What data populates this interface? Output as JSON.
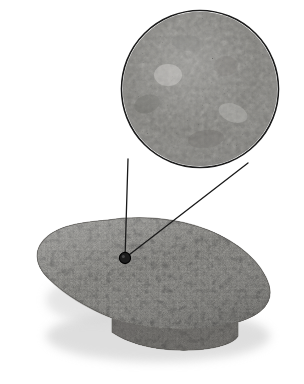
{
  "figure": {
    "background_color": "#ffffff",
    "width": 304,
    "height": 384,
    "caption": "",
    "labels": []
  },
  "specimen": {
    "name": "rock-slab",
    "description": "Elongated oval granular rock slab shown in oblique perspective with visible side thickness and cast shadow",
    "bounds": {
      "x": 33,
      "y": 216,
      "width": 238,
      "height": 136
    },
    "fill_color": "#a9a8a4",
    "side_color": "#6e6d6a",
    "shadow_color": "#cfcfcf",
    "texture": "coarse-granular",
    "texture_light": "#d6d5d1",
    "texture_dark": "#4f4e4c"
  },
  "callout": {
    "name": "magnifier-inset",
    "description": "Circular magnified view of the rock surface microstructure",
    "center_x": 200,
    "center_y": 89,
    "radius": 78,
    "ring_color": "#1a1a1a",
    "ring_width": 1.6,
    "fill_color": "#b4b3af",
    "texture": "fine-mottled",
    "texture_light": "#dedddA",
    "texture_dark": "#5c5b59"
  },
  "pointer": {
    "name": "callout-leader-lines",
    "color": "#1a1a1a",
    "width": 1.3,
    "target_dot": {
      "name": "sample-point",
      "x": 125,
      "y": 258,
      "radius": 5.5,
      "fill_color": "#1c1c1c",
      "ring_color": "#000000"
    },
    "lines": [
      {
        "name": "left-leader",
        "x1": 125,
        "y1": 258,
        "x2": 128,
        "y2": 159
      },
      {
        "name": "right-leader",
        "x1": 125,
        "y1": 258,
        "x2": 248,
        "y2": 163
      }
    ]
  },
  "chart_data": {
    "type": "diagram",
    "elements": [
      {
        "label": "rock slab",
        "kind": "specimen",
        "cx": 152,
        "cy": 284
      },
      {
        "label": "magnified circular inset",
        "kind": "callout",
        "cx": 200,
        "cy": 89,
        "r": 78
      },
      {
        "label": "sample point marker",
        "kind": "marker",
        "cx": 125,
        "cy": 258,
        "r": 5.5
      }
    ]
  }
}
